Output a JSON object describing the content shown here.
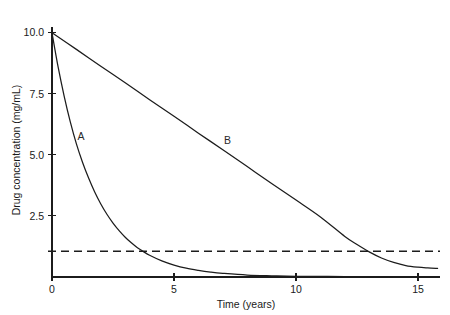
{
  "chart_data": {
    "type": "line",
    "title": "",
    "xlabel": "Time (years)",
    "ylabel": "Drug concentration (mg/mL)",
    "xlim": [
      0,
      15.9
    ],
    "ylim": [
      0,
      10.4
    ],
    "grid": false,
    "legend_position": "inline-labels",
    "xticks": [
      0,
      5,
      10,
      15
    ],
    "xtick_labels": [
      "0",
      "5",
      "10",
      "15"
    ],
    "yticks": [
      2.5,
      5.0,
      7.5,
      10.0
    ],
    "ytick_labels": [
      "2.5",
      "5.0",
      "7.5",
      "10.0"
    ],
    "annotations": [
      {
        "text": "A",
        "x": 1.05,
        "y": 5.6
      },
      {
        "text": "B",
        "x": 7.05,
        "y": 5.45
      }
    ],
    "threshold": {
      "label": "",
      "value": 1.05,
      "style": "dashed"
    },
    "series": [
      {
        "name": "A",
        "style": "solid",
        "x": [
          0,
          0.25,
          0.5,
          0.75,
          1.0,
          1.25,
          1.5,
          1.75,
          2.0,
          2.25,
          2.5,
          2.75,
          3.0,
          3.25,
          3.5,
          3.75,
          4.0,
          4.5,
          5.0,
          5.5,
          6.0,
          6.5,
          7.0,
          8.0,
          9.0,
          10.0,
          12.0,
          14.0,
          15.8
        ],
        "values": [
          10.0,
          8.6,
          7.4,
          6.35,
          5.45,
          4.7,
          4.05,
          3.48,
          2.99,
          2.57,
          2.21,
          1.9,
          1.63,
          1.4,
          1.2,
          1.04,
          0.89,
          0.66,
          0.49,
          0.36,
          0.27,
          0.2,
          0.15,
          0.08,
          0.05,
          0.03,
          0.02,
          0.01,
          0.01
        ]
      },
      {
        "name": "B",
        "style": "solid",
        "x": [
          0,
          1,
          2,
          3,
          4,
          5,
          6,
          7,
          8,
          9,
          10,
          11,
          12,
          12.5,
          13,
          13.5,
          14,
          14.5,
          15,
          15.4,
          15.8
        ],
        "values": [
          10.0,
          9.32,
          8.63,
          7.95,
          7.26,
          6.58,
          5.89,
          5.21,
          4.52,
          3.83,
          3.15,
          2.46,
          1.66,
          1.33,
          1.03,
          0.78,
          0.6,
          0.47,
          0.4,
          0.37,
          0.35
        ]
      }
    ]
  }
}
